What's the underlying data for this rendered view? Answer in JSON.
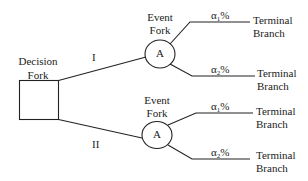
{
  "diagram": {
    "type": "decision-tree",
    "decision_node": {
      "label_line1": "Decision",
      "label_line2": "Fork",
      "shape": "square"
    },
    "branches": [
      {
        "label": "I",
        "event_node": {
          "label_line1": "Event",
          "label_line2": "Fork",
          "letter": "A",
          "shape": "circle"
        },
        "outcomes": [
          {
            "prob_symbol": "α",
            "prob_sub": "1",
            "prob_suffix": "%",
            "terminal_line1": "Terminal",
            "terminal_line2": "Branch"
          },
          {
            "prob_symbol": "α",
            "prob_sub": "2",
            "prob_suffix": "%",
            "terminal_line1": "Terminal",
            "terminal_line2": "Branch"
          }
        ]
      },
      {
        "label": "II",
        "event_node": {
          "label_line1": "Event",
          "label_line2": "Fork",
          "letter": "A",
          "shape": "circle"
        },
        "outcomes": [
          {
            "prob_symbol": "α",
            "prob_sub": "1",
            "prob_suffix": "%",
            "terminal_line1": "Terminal",
            "terminal_line2": "Branch"
          },
          {
            "prob_symbol": "α",
            "prob_sub": "2",
            "prob_suffix": "%",
            "terminal_line1": "Terminal",
            "terminal_line2": "Branch"
          }
        ]
      }
    ],
    "colors": {
      "stroke": "#222222",
      "background": "#ffffff"
    }
  }
}
